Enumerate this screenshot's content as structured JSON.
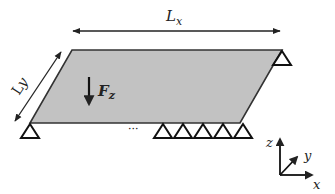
{
  "diagram": {
    "type": "plate-structure-schematic",
    "plate": {
      "shape": "parallelogram",
      "fill": "#c2c2c2",
      "stroke": "#333333",
      "points": [
        [
          72,
          50
        ],
        [
          282,
          50
        ],
        [
          240,
          123
        ],
        [
          30,
          123
        ]
      ]
    },
    "dimensions": {
      "lx": {
        "label_main": "L",
        "label_sub": "x",
        "arrow": [
          [
            73,
            31
          ],
          [
            280,
            31
          ]
        ]
      },
      "ly": {
        "label_main": "L",
        "label_sub": "y",
        "arrow": [
          [
            61,
            52
          ],
          [
            15,
            121
          ]
        ]
      }
    },
    "load": {
      "label_main": "F",
      "label_sub": "z",
      "arrow": [
        [
          89,
          78
        ],
        [
          89,
          107
        ]
      ],
      "direction": "down"
    },
    "supports": {
      "symbol": "triangle",
      "positions": [
        [
          30,
          123
        ],
        [
          282,
          50
        ],
        [
          163,
          123
        ],
        [
          183,
          123
        ],
        [
          203,
          123
        ],
        [
          223,
          123
        ],
        [
          243,
          123
        ]
      ],
      "ellipsis": "···"
    },
    "axes": {
      "origin": [
        280,
        175
      ],
      "z_label": "z",
      "y_label": "y",
      "x_label": "x"
    },
    "colors": {
      "line": "#222222",
      "plate_fill": "#c2c2c2",
      "background": "#ffffff"
    }
  }
}
